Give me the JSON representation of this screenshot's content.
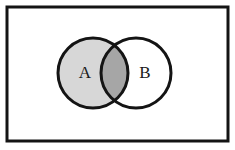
{
  "figure": {
    "type": "venn-diagram",
    "title": "",
    "background_color": "#ffffff",
    "frame": {
      "name": "outer-border",
      "x": 7,
      "y": 7,
      "width": 221,
      "height": 134,
      "stroke_color": "#141414",
      "stroke_width": 3,
      "fill": "#ffffff"
    },
    "stroke_color": "#141414",
    "stroke_width": 3,
    "sets": [
      {
        "id": "A",
        "label": "A",
        "cx": 93,
        "cy": 73,
        "r": 35,
        "fill": "#d7d7d7",
        "label_x": 85,
        "label_y": 74,
        "shaded": true
      },
      {
        "id": "B",
        "label": "B",
        "cx": 136,
        "cy": 73,
        "r": 35,
        "fill": "#ffffff",
        "label_x": 145,
        "label_y": 74,
        "shaded": false
      }
    ],
    "intersection": {
      "id": "A-and-B",
      "label": "",
      "fill": "#a6a6a6",
      "shaded": true
    }
  }
}
